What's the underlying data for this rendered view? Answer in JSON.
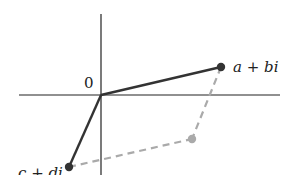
{
  "diagram": {
    "origin_label": "0",
    "points": [
      {
        "label": "a + bi",
        "role": "first-addend"
      },
      {
        "label": "c + di",
        "role": "second-addend"
      },
      {
        "label": "",
        "role": "sum"
      }
    ],
    "colors": {
      "axes": "#222222",
      "vectors": "#333333",
      "dashed": "#aaaaaa",
      "sum_point": "#aaaaaa"
    }
  }
}
